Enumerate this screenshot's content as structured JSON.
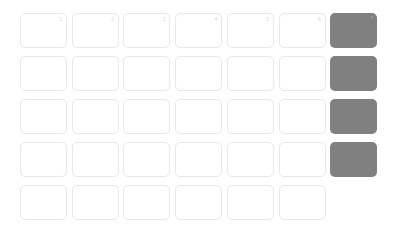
{
  "calendar": {
    "colors": {
      "page_background": "#ffffff",
      "cell_background": "#ffffff",
      "cell_border": "#e8e8e8",
      "highlight_background": "#808080",
      "day_number_text": "#d8d8d8",
      "highlight_day_number_text": "#a8a8a8"
    },
    "layout": {
      "columns": 7,
      "rows": 5,
      "cell_width": 47,
      "cell_height": 35,
      "column_step": 51.7,
      "row_step": 43,
      "origin_x": 20,
      "origin_y": 13,
      "corner_radius": 5
    },
    "weeks": [
      {
        "name": "week-1",
        "days": [
          {
            "number": "1",
            "highlighted": false,
            "empty": false,
            "show_number": true
          },
          {
            "number": "2",
            "highlighted": false,
            "empty": false,
            "show_number": true
          },
          {
            "number": "3",
            "highlighted": false,
            "empty": false,
            "show_number": true
          },
          {
            "number": "4",
            "highlighted": false,
            "empty": false,
            "show_number": true
          },
          {
            "number": "5",
            "highlighted": false,
            "empty": false,
            "show_number": true
          },
          {
            "number": "6",
            "highlighted": false,
            "empty": false,
            "show_number": true
          },
          {
            "number": "7",
            "highlighted": true,
            "empty": false,
            "show_number": true
          }
        ]
      },
      {
        "name": "week-2",
        "days": [
          {
            "number": "",
            "highlighted": false,
            "empty": false,
            "show_number": false
          },
          {
            "number": "",
            "highlighted": false,
            "empty": false,
            "show_number": false
          },
          {
            "number": "",
            "highlighted": false,
            "empty": false,
            "show_number": false
          },
          {
            "number": "",
            "highlighted": false,
            "empty": false,
            "show_number": false
          },
          {
            "number": "",
            "highlighted": false,
            "empty": false,
            "show_number": false
          },
          {
            "number": "",
            "highlighted": false,
            "empty": false,
            "show_number": false
          },
          {
            "number": "",
            "highlighted": true,
            "empty": false,
            "show_number": false
          }
        ]
      },
      {
        "name": "week-3",
        "days": [
          {
            "number": "",
            "highlighted": false,
            "empty": false,
            "show_number": false
          },
          {
            "number": "",
            "highlighted": false,
            "empty": false,
            "show_number": false
          },
          {
            "number": "",
            "highlighted": false,
            "empty": false,
            "show_number": false
          },
          {
            "number": "",
            "highlighted": false,
            "empty": false,
            "show_number": false
          },
          {
            "number": "",
            "highlighted": false,
            "empty": false,
            "show_number": false
          },
          {
            "number": "",
            "highlighted": false,
            "empty": false,
            "show_number": false
          },
          {
            "number": "",
            "highlighted": true,
            "empty": false,
            "show_number": false
          }
        ]
      },
      {
        "name": "week-4",
        "days": [
          {
            "number": "",
            "highlighted": false,
            "empty": false,
            "show_number": false
          },
          {
            "number": "",
            "highlighted": false,
            "empty": false,
            "show_number": false
          },
          {
            "number": "",
            "highlighted": false,
            "empty": false,
            "show_number": false
          },
          {
            "number": "",
            "highlighted": false,
            "empty": false,
            "show_number": false
          },
          {
            "number": "",
            "highlighted": false,
            "empty": false,
            "show_number": false
          },
          {
            "number": "",
            "highlighted": false,
            "empty": false,
            "show_number": false
          },
          {
            "number": "",
            "highlighted": true,
            "empty": false,
            "show_number": false
          }
        ]
      },
      {
        "name": "week-5",
        "days": [
          {
            "number": "",
            "highlighted": false,
            "empty": false,
            "show_number": false
          },
          {
            "number": "",
            "highlighted": false,
            "empty": false,
            "show_number": false
          },
          {
            "number": "",
            "highlighted": false,
            "empty": false,
            "show_number": false
          },
          {
            "number": "",
            "highlighted": false,
            "empty": false,
            "show_number": false
          },
          {
            "number": "",
            "highlighted": false,
            "empty": false,
            "show_number": false
          },
          {
            "number": "",
            "highlighted": false,
            "empty": false,
            "show_number": false
          },
          {
            "number": "",
            "highlighted": false,
            "empty": true,
            "show_number": false
          }
        ]
      }
    ]
  }
}
